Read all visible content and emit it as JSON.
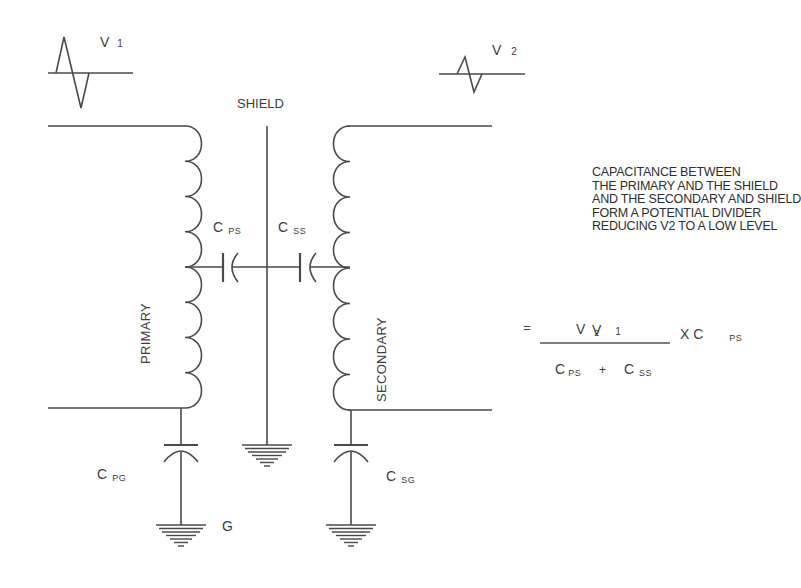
{
  "signals": {
    "v1": {
      "main": "V",
      "sub": "1"
    },
    "v2": {
      "main": "V",
      "sub": "2"
    }
  },
  "labels": {
    "shield": "SHIELD",
    "primary": "PRIMARY",
    "secondary": "SECONDARY",
    "ground": "G"
  },
  "capacitors": {
    "cps": {
      "main": "C",
      "sub": "PS"
    },
    "css": {
      "main": "C",
      "sub": "SS"
    },
    "cpg": {
      "main": "C",
      "sub": "PG"
    },
    "csg": {
      "main": "C",
      "sub": "SG"
    }
  },
  "note": [
    "CAPACITANCE BETWEEN",
    "THE PRIMARY AND THE SHIELD",
    "AND THE SECONDARY AND SHIELD",
    "FORM A POTENTIAL DIVIDER",
    "REDUCING V2 TO A LOW LEVEL"
  ],
  "formula": {
    "lhs_main": "V",
    "lhs_sub": "2",
    "equals": "=",
    "num_main": "V",
    "num_sub": "1",
    "times": "X C",
    "times_sub": "PS",
    "den_c1": "C",
    "den_c1_sub": "PS",
    "plus": "+",
    "den_c2": "C",
    "den_c2_sub": "SS"
  }
}
